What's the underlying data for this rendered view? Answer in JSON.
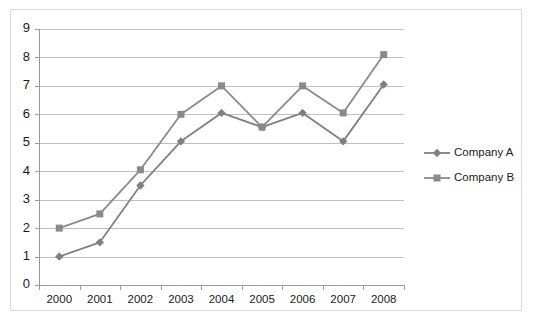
{
  "chart_data": {
    "type": "line",
    "title": "",
    "xlabel": "",
    "ylabel": "",
    "categories": [
      "2000",
      "2001",
      "2002",
      "2003",
      "2004",
      "2005",
      "2006",
      "2007",
      "2008"
    ],
    "ylim": [
      0,
      9
    ],
    "yticks": [
      "0",
      "1",
      "2",
      "3",
      "4",
      "5",
      "6",
      "7",
      "8",
      "9"
    ],
    "grid": true,
    "legend_position": "right",
    "series": [
      {
        "name": "Company A",
        "marker": "diamond",
        "color": "#808080",
        "values": [
          1.0,
          1.5,
          3.5,
          5.05,
          6.05,
          5.55,
          6.05,
          5.05,
          7.05
        ]
      },
      {
        "name": "Company B",
        "marker": "square",
        "color": "#8a8a8a",
        "values": [
          2.0,
          2.5,
          4.05,
          6.0,
          7.0,
          5.55,
          7.0,
          6.05,
          8.1
        ]
      }
    ]
  },
  "style": {
    "border_color": "#d9d9d9",
    "gridline_color": "#bfbfbf",
    "axis_color": "#9a9a9a",
    "text_color": "#1a1a1a",
    "background": "#ffffff"
  }
}
